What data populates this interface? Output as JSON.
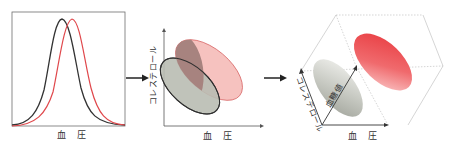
{
  "panels": [
    {
      "id": "distribution-1d",
      "xlabel": "血 圧",
      "curves": [
        {
          "name": "group-black",
          "color": "#333333",
          "peak_x": 62
        },
        {
          "name": "group-red",
          "color": "#e0484c",
          "peak_x": 72
        }
      ]
    },
    {
      "id": "distribution-2d",
      "xlabel": "血 圧",
      "ylabel": "コレステロール",
      "ellipses": [
        {
          "name": "group-red",
          "fill": "#f4b7b4",
          "stroke": "#d96a6a"
        },
        {
          "name": "group-black",
          "fill": "#b9bdb3",
          "stroke": "#2f2f2f"
        }
      ],
      "overlap_fill": "#a7837f"
    },
    {
      "id": "distribution-3d",
      "xlabel": "血 圧",
      "ylabel": "コレステロール",
      "zlabel": "血糖値",
      "blobs": [
        {
          "name": "group-red",
          "color": "#e8383d"
        },
        {
          "name": "group-gray",
          "color": "#a9aca4"
        }
      ]
    }
  ],
  "arrows": [
    {
      "from": "distribution-1d",
      "to": "distribution-2d"
    },
    {
      "from": "distribution-2d",
      "to": "distribution-3d"
    }
  ]
}
